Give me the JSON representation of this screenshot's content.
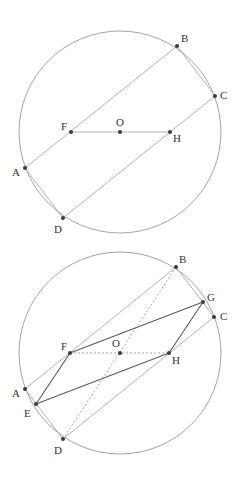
{
  "figures": [
    {
      "id": "figure-1",
      "circle": {
        "cx": 120,
        "cy": 132,
        "r": 101
      },
      "points": {
        "A": {
          "x": 25,
          "y": 168,
          "label": "A",
          "lx": 12,
          "ly": 176
        },
        "B": {
          "x": 177,
          "y": 46,
          "label": "B",
          "lx": 181,
          "ly": 42
        },
        "C": {
          "x": 215,
          "y": 96,
          "label": "C",
          "lx": 220,
          "ly": 99
        },
        "D": {
          "x": 63,
          "y": 218,
          "label": "D",
          "lx": 54,
          "ly": 233
        },
        "F": {
          "x": 71,
          "y": 132,
          "label": "F",
          "lx": 61,
          "ly": 130
        },
        "O": {
          "x": 120,
          "y": 132,
          "label": "O",
          "lx": 116,
          "ly": 126
        },
        "H": {
          "x": 170,
          "y": 132,
          "label": "H",
          "lx": 173,
          "ly": 142
        }
      },
      "segments": [
        {
          "from": "A",
          "to": "B",
          "style": "line"
        },
        {
          "from": "C",
          "to": "D",
          "style": "line"
        },
        {
          "from": "B",
          "to": "C",
          "style": "line"
        },
        {
          "from": "A",
          "to": "D",
          "style": "line"
        },
        {
          "from": "F",
          "to": "H",
          "style": "line"
        }
      ]
    },
    {
      "id": "figure-2",
      "circle": {
        "cx": 120,
        "cy": 353,
        "r": 101
      },
      "points": {
        "A": {
          "x": 25,
          "y": 389,
          "label": "A",
          "lx": 12,
          "ly": 397
        },
        "B": {
          "x": 176,
          "y": 267,
          "label": "B",
          "lx": 179,
          "ly": 263
        },
        "G": {
          "x": 203,
          "y": 302,
          "label": "G",
          "lx": 207,
          "ly": 301
        },
        "C": {
          "x": 214,
          "y": 317,
          "label": "C",
          "lx": 220,
          "ly": 320
        },
        "D": {
          "x": 63,
          "y": 439,
          "label": "D",
          "lx": 54,
          "ly": 454
        },
        "E": {
          "x": 36,
          "y": 404,
          "label": "E",
          "lx": 24,
          "ly": 417
        },
        "F": {
          "x": 70,
          "y": 353,
          "label": "F",
          "lx": 61,
          "ly": 350
        },
        "O": {
          "x": 120,
          "y": 353,
          "label": "O",
          "lx": 112,
          "ly": 347
        },
        "H": {
          "x": 169,
          "y": 353,
          "label": "H",
          "lx": 172,
          "ly": 364
        }
      },
      "segments": [
        {
          "from": "A",
          "to": "B",
          "style": "line"
        },
        {
          "from": "C",
          "to": "D",
          "style": "line"
        },
        {
          "from": "B",
          "to": "C",
          "style": "line"
        },
        {
          "from": "A",
          "to": "D",
          "style": "line"
        },
        {
          "from": "F",
          "to": "H",
          "style": "line-dotted"
        },
        {
          "from": "B",
          "to": "D",
          "style": "line-dotted"
        },
        {
          "from": "E",
          "to": "F",
          "style": "line-dark"
        },
        {
          "from": "F",
          "to": "G",
          "style": "line-dark"
        },
        {
          "from": "G",
          "to": "H",
          "style": "line-dark"
        },
        {
          "from": "H",
          "to": "E",
          "style": "line-dark"
        }
      ]
    }
  ]
}
